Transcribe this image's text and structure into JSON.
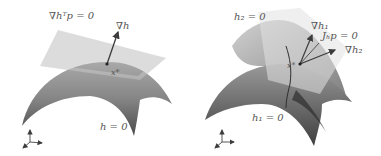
{
  "panels": [
    {
      "id": "single-constraint",
      "labels": {
        "tangent_plane": "∇hᵀp = 0",
        "gradient": "∇h",
        "point": "x*",
        "surface": "h = 0"
      }
    },
    {
      "id": "two-constraints",
      "labels": {
        "surface2": "h₂ = 0",
        "gradient1": "∇h₁",
        "tangent_line": "Jₕp = 0",
        "gradient2": "∇h₂",
        "point": "x*",
        "surface1": "h₁ = 0"
      }
    }
  ],
  "colors": {
    "surface_dark": "#4a4a4a",
    "surface_light": "#a8a8a8",
    "plane": "#d4d4d4",
    "arrow": "#3c3c3c",
    "text": "#555555"
  }
}
